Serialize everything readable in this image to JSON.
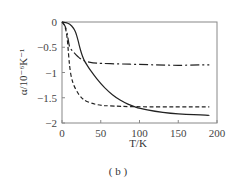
{
  "chart_data": {
    "type": "line",
    "title": "",
    "caption": "( b )",
    "xlabel": "T/K",
    "ylabel": "α/10⁻⁶K⁻¹",
    "xlim": [
      0,
      200
    ],
    "ylim": [
      -2,
      0
    ],
    "xticks": [
      0,
      50,
      100,
      150,
      200
    ],
    "xtick_labels": [
      "0",
      "50",
      "100",
      "150",
      "200"
    ],
    "yticks": [
      0,
      -0.5,
      -1,
      -1.5,
      -2
    ],
    "ytick_labels": [
      "0",
      "−0.5",
      "−1",
      "−1.5",
      "−2"
    ],
    "grid": false,
    "legend": null,
    "series": [
      {
        "name": "solid",
        "style": "solid",
        "x": [
          0,
          5,
          10,
          15,
          18,
          20,
          22,
          25,
          28,
          30,
          35,
          40,
          50,
          60,
          70,
          80,
          90,
          100,
          120,
          140,
          160,
          180,
          190
        ],
        "y": [
          0,
          -0.01,
          -0.04,
          -0.12,
          -0.22,
          -0.32,
          -0.45,
          -0.62,
          -0.74,
          -0.8,
          -0.92,
          -1.03,
          -1.22,
          -1.38,
          -1.5,
          -1.59,
          -1.66,
          -1.71,
          -1.77,
          -1.81,
          -1.83,
          -1.84,
          -1.85
        ]
      },
      {
        "name": "dash-dot",
        "style": "dashdot",
        "x": [
          0,
          3,
          5,
          7,
          8,
          9,
          10,
          12,
          15,
          20,
          25,
          30,
          40,
          50,
          75,
          100,
          125,
          150,
          175,
          190
        ],
        "y": [
          0,
          -0.05,
          -0.12,
          -0.25,
          -0.35,
          -0.45,
          -0.5,
          -0.55,
          -0.6,
          -0.68,
          -0.74,
          -0.78,
          -0.81,
          -0.82,
          -0.83,
          -0.84,
          -0.85,
          -0.86,
          -0.85,
          -0.85
        ]
      },
      {
        "name": "dashed",
        "style": "dashed",
        "x": [
          0,
          3,
          5,
          7,
          8,
          9,
          10,
          12,
          15,
          20,
          25,
          30,
          40,
          50,
          60,
          75,
          100,
          150,
          190
        ],
        "y": [
          0,
          -0.05,
          -0.15,
          -0.35,
          -0.55,
          -0.75,
          -0.9,
          -1.1,
          -1.25,
          -1.4,
          -1.5,
          -1.56,
          -1.62,
          -1.65,
          -1.66,
          -1.67,
          -1.68,
          -1.68,
          -1.68
        ]
      }
    ]
  }
}
